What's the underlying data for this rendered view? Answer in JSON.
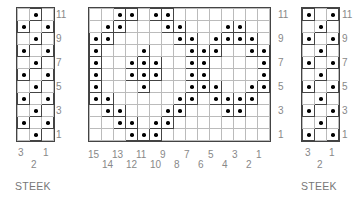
{
  "chart_data": {
    "type": "table",
    "left_steek": {
      "label": "STEEK",
      "columns": 3,
      "rows": 11,
      "col_labels": [
        "3",
        "2",
        "1"
      ],
      "row_labels": [
        "11",
        "9",
        "7",
        "5",
        "3",
        "1"
      ],
      "dots_by_row_top_to_bottom": [
        [
          2
        ],
        [
          1,
          3
        ],
        [
          2
        ],
        [
          1,
          3
        ],
        [
          2
        ],
        [
          1,
          3
        ],
        [
          2
        ],
        [
          1,
          3
        ],
        [
          2
        ],
        [
          1,
          3
        ],
        [
          2
        ]
      ]
    },
    "main": {
      "columns": 15,
      "rows": 11,
      "col_labels_top": [
        "15",
        "13",
        "11",
        "9",
        "7",
        "5",
        "3",
        "1"
      ],
      "col_labels_bottom": [
        "14",
        "12",
        "10",
        "8",
        "6",
        "4",
        "2"
      ],
      "row_labels": [
        "11",
        "9",
        "7",
        "5",
        "3",
        "1"
      ],
      "dots_by_row_top_to_bottom": [
        [
          3,
          4,
          6,
          7
        ],
        [
          2,
          3,
          7,
          8,
          12,
          13
        ],
        [
          1,
          2,
          8,
          9,
          11,
          12,
          13,
          14
        ],
        [
          1,
          5,
          9,
          10,
          11,
          14,
          15
        ],
        [
          1,
          4,
          5,
          6,
          9,
          10,
          15
        ],
        [
          1,
          4,
          5,
          6,
          9,
          10,
          15
        ],
        [
          1,
          5,
          9,
          10,
          11,
          14,
          15
        ],
        [
          1,
          2,
          8,
          9,
          11,
          12,
          13,
          14
        ],
        [
          2,
          3,
          7,
          8,
          12,
          13
        ],
        [
          3,
          4,
          6,
          7
        ],
        [
          4,
          5,
          6
        ]
      ]
    },
    "right_steek": {
      "label": "STEEK",
      "columns": 3,
      "rows": 11,
      "col_labels": [
        "3",
        "2",
        "1"
      ],
      "row_labels": [
        "11",
        "9",
        "7",
        "5",
        "3",
        "1"
      ],
      "dots_by_row_top_to_bottom": [
        [
          1,
          3
        ],
        [
          2
        ],
        [
          1,
          3
        ],
        [
          2
        ],
        [
          1,
          3
        ],
        [
          2
        ],
        [
          1,
          3
        ],
        [
          2
        ],
        [
          1,
          3
        ],
        [
          2
        ],
        [
          1,
          3
        ]
      ]
    }
  },
  "labels": {
    "steek_left": "STEEK",
    "steek_right": "STEEK"
  }
}
